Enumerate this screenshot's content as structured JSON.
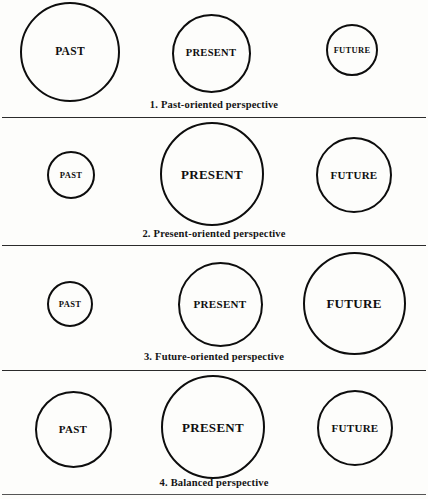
{
  "figure": {
    "line_color": "#2b2b2b",
    "circle_color": "#0d0d0d",
    "background": "#fdfdfb"
  },
  "rows": [
    {
      "caption_number": "1.",
      "caption_text": "Past-oriented perspective",
      "circles": [
        {
          "label": "PAST",
          "cx": 70,
          "cy": 52,
          "d": 100,
          "font": 11.5
        },
        {
          "label": "PRESENT",
          "cx": 211,
          "cy": 53,
          "d": 79,
          "font": 10.5
        },
        {
          "label": "FUTURE",
          "cx": 352,
          "cy": 50,
          "d": 52,
          "font": 8.5
        }
      ]
    },
    {
      "caption_number": "2.",
      "caption_text": "Present-oriented perspective",
      "circles": [
        {
          "label": "PAST",
          "cx": 71,
          "cy": 175,
          "d": 48,
          "font": 8.5
        },
        {
          "label": "PRESENT",
          "cx": 212,
          "cy": 174,
          "d": 104,
          "font": 13
        },
        {
          "label": "FUTURE",
          "cx": 354,
          "cy": 175,
          "d": 76,
          "font": 11
        }
      ]
    },
    {
      "caption_number": "3.",
      "caption_text": "Future-oriented perspective",
      "circles": [
        {
          "label": "PAST",
          "cx": 70,
          "cy": 304,
          "d": 46,
          "font": 8.5
        },
        {
          "label": "PRESENT",
          "cx": 220,
          "cy": 304,
          "d": 85,
          "font": 11
        },
        {
          "label": "FUTURE",
          "cx": 354,
          "cy": 303,
          "d": 103,
          "font": 13
        }
      ]
    },
    {
      "caption_number": "4.",
      "caption_text": "Balanced perspective",
      "circles": [
        {
          "label": "PAST",
          "cx": 73,
          "cy": 429,
          "d": 77,
          "font": 11
        },
        {
          "label": "PRESENT",
          "cx": 213,
          "cy": 427,
          "d": 104,
          "font": 13
        },
        {
          "label": "FUTURE",
          "cx": 355,
          "cy": 428,
          "d": 76,
          "font": 11
        }
      ]
    }
  ],
  "captions_y": [
    99,
    228,
    351,
    477
  ],
  "dividers_y": [
    117,
    245,
    370,
    494
  ]
}
